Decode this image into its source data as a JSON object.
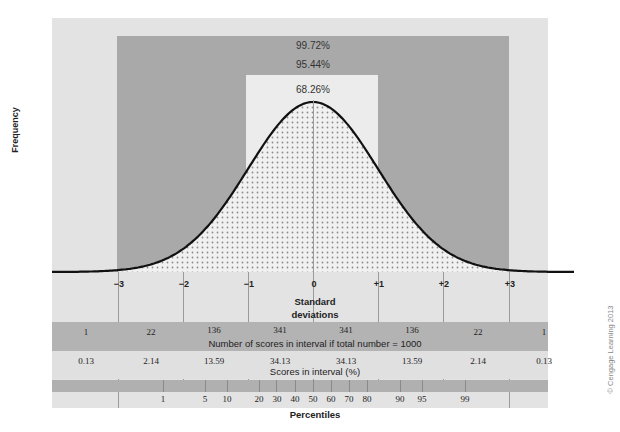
{
  "y_axis_label": "Frequency",
  "coverage_labels": {
    "three_sd": "99.72%",
    "two_sd": "95.44%",
    "one_sd": "68.26%"
  },
  "sd_ticks": [
    "−3",
    "−2",
    "−1",
    "0",
    "+1",
    "+2",
    "+3"
  ],
  "sd_axis_label_line1": "Standard",
  "sd_axis_label_line2": "deviations",
  "counts_row": {
    "values": [
      "1",
      "22",
      "136",
      "341",
      "341",
      "136",
      "22",
      "1"
    ],
    "caption": "Number of scores in interval if total number = 1000"
  },
  "percent_row": {
    "values": [
      "0.13",
      "2.14",
      "13.59",
      "34.13",
      "34.13",
      "13.59",
      "2.14",
      "0.13"
    ],
    "caption": "Scores in interval (%)"
  },
  "percentile_ticks": [
    "1",
    "5",
    "10",
    "20",
    "30",
    "40",
    "50",
    "60",
    "70",
    "80",
    "90",
    "95",
    "99"
  ],
  "percentile_axis_label": "Percentiles",
  "copyright": "© Cengage Learning 2013",
  "colors": {
    "panel": "#e3e3e3",
    "dark_band": "#a9a9a9",
    "inner_band": "#ececec",
    "curve": "#111111"
  },
  "chart_data": {
    "type": "area",
    "xlabel": "Standard deviations",
    "ylabel": "Frequency",
    "x": [
      -3,
      -2,
      -1,
      0,
      1,
      2,
      3
    ],
    "interval_counts_per_1000": [
      1,
      22,
      136,
      341,
      341,
      136,
      22,
      1
    ],
    "interval_percent": [
      0.13,
      2.14,
      13.59,
      34.13,
      34.13,
      13.59,
      2.14,
      0.13
    ],
    "coverage": {
      "within_1sd": 68.26,
      "within_2sd": 95.44,
      "within_3sd": 99.72
    },
    "percentiles": [
      1,
      5,
      10,
      20,
      30,
      40,
      50,
      60,
      70,
      80,
      90,
      95,
      99
    ]
  }
}
